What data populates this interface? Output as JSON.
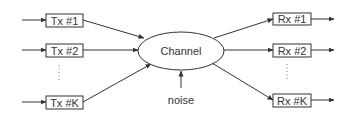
{
  "diagram": {
    "colors": {
      "stroke": "#333333",
      "text": "#333333",
      "box_fill": "#ffffff",
      "background": "#ffffff"
    },
    "channel": {
      "label": "Channel"
    },
    "noise": {
      "label": "noise"
    },
    "transmitters": [
      {
        "label": "Tx #1"
      },
      {
        "label": "Tx #2"
      },
      {
        "label": "Tx #K"
      }
    ],
    "receivers": [
      {
        "label": "Rx #1"
      },
      {
        "label": "Rx #2"
      },
      {
        "label": "Rx #K"
      }
    ],
    "ellipsis": "⋮"
  }
}
